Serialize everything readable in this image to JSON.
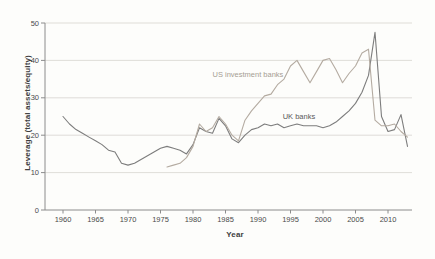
{
  "figure": {
    "background": "#fdfdfb",
    "axis_color": "#8c8c8c",
    "grid_color": "#d7d4cf",
    "tick_label_color": "#4a4a4a",
    "title_color": "#3f3f3f"
  },
  "chart_data": {
    "type": "line",
    "title": "",
    "xlabel": "Year",
    "ylabel": "Leverage (total assets/equity)",
    "xlim": [
      1957.2,
      2013.7
    ],
    "ylim": [
      0,
      50
    ],
    "x_ticks": [
      1960,
      1965,
      1970,
      1975,
      1980,
      1985,
      1990,
      1995,
      2000,
      2005,
      2010
    ],
    "y_ticks": [
      0,
      10,
      20,
      30,
      40,
      50
    ],
    "grid": "horizontal",
    "legend_position": "inline-labels",
    "series": [
      {
        "name": "UK banks",
        "color": "#7d7d7d",
        "label_color": "#595959",
        "label_at": [
          1993.8,
          25.0
        ],
        "x": [
          1960,
          1961,
          1962,
          1963,
          1964,
          1965,
          1966,
          1967,
          1968,
          1969,
          1970,
          1971,
          1972,
          1973,
          1974,
          1975,
          1976,
          1977,
          1978,
          1979,
          1980,
          1981,
          1982,
          1983,
          1984,
          1985,
          1986,
          1987,
          1988,
          1989,
          1990,
          1991,
          1992,
          1993,
          1994,
          1995,
          1996,
          1997,
          1998,
          1999,
          2000,
          2001,
          2002,
          2003,
          2004,
          2005,
          2006,
          2007,
          2008,
          2009,
          2010,
          2011,
          2012,
          2013
        ],
        "values": [
          25,
          23,
          21.5,
          20.5,
          19.5,
          18.5,
          17.5,
          16,
          15.5,
          12.5,
          12,
          12.5,
          13.5,
          14.5,
          15.5,
          16.5,
          17,
          16.5,
          16,
          15,
          17.5,
          22,
          21,
          20.5,
          24.5,
          22.5,
          19,
          18,
          20,
          21.5,
          22,
          23,
          22.5,
          23,
          22,
          22.5,
          23,
          22.5,
          22.5,
          22.5,
          22,
          22.5,
          23.5,
          25,
          26.5,
          28.5,
          31.5,
          36,
          47.5,
          25,
          21,
          21.5,
          25.5,
          17
        ]
      },
      {
        "name": "US investment banks",
        "color": "#b4aba1",
        "label_color": "#a69d93",
        "label_at": [
          1983.0,
          36.3
        ],
        "x": [
          1976,
          1977,
          1978,
          1979,
          1980,
          1981,
          1982,
          1983,
          1984,
          1985,
          1986,
          1987,
          1988,
          1989,
          1990,
          1991,
          1992,
          1993,
          1994,
          1995,
          1996,
          1997,
          1998,
          1999,
          2000,
          2001,
          2002,
          2003,
          2004,
          2005,
          2006,
          2007,
          2008,
          2009,
          2010,
          2011,
          2012,
          2013
        ],
        "values": [
          11.5,
          12,
          12.5,
          14,
          17,
          23,
          21,
          22,
          25,
          23,
          20,
          18.5,
          24,
          26.5,
          28.5,
          30.5,
          31,
          33.5,
          35,
          38.5,
          40,
          37,
          34,
          37,
          40,
          40.5,
          37.5,
          34,
          36.5,
          38.5,
          42,
          43,
          24,
          22.5,
          22.5,
          23,
          21,
          19.5
        ]
      }
    ]
  }
}
